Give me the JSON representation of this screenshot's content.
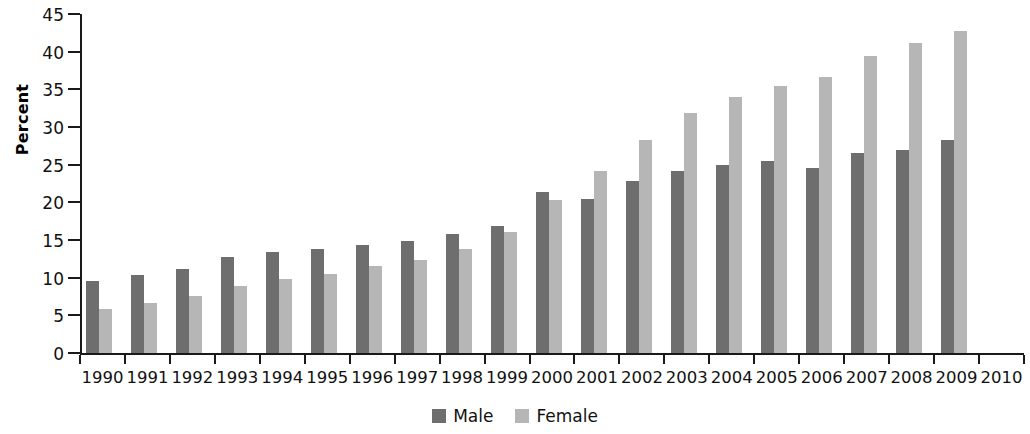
{
  "chart_data": {
    "type": "bar",
    "title": "",
    "xlabel": "",
    "ylabel": "Percent",
    "ylim": [
      0,
      45
    ],
    "yticks": [
      0,
      5,
      10,
      15,
      20,
      25,
      30,
      35,
      40,
      45
    ],
    "grid": false,
    "legend_position": "bottom",
    "categories": [
      "1990",
      "1991",
      "1992",
      "1993",
      "1994",
      "1995",
      "1996",
      "1997",
      "1998",
      "1999",
      "2000",
      "2001",
      "2002",
      "2003",
      "2004",
      "2005",
      "2006",
      "2007",
      "2008",
      "2009",
      "2010"
    ],
    "series": [
      {
        "name": "Male",
        "color": "#6e6e6e",
        "values": [
          9.6,
          10.3,
          11.2,
          12.7,
          13.4,
          13.8,
          14.4,
          14.9,
          15.8,
          16.9,
          21.4,
          20.4,
          22.9,
          24.1,
          24.9,
          25.5,
          24.6,
          26.6,
          26.9,
          28.3,
          null
        ]
      },
      {
        "name": "Female",
        "color": "#b6b6b6",
        "values": [
          5.9,
          6.6,
          7.6,
          8.9,
          9.8,
          10.5,
          11.5,
          12.3,
          13.8,
          16.1,
          20.3,
          24.2,
          28.3,
          31.8,
          34.0,
          35.4,
          36.6,
          39.4,
          41.2,
          42.8,
          null
        ]
      }
    ]
  },
  "legend": {
    "items": [
      {
        "label": "Male",
        "swatch": "male-swatch"
      },
      {
        "label": "Female",
        "swatch": "female-swatch"
      }
    ]
  }
}
